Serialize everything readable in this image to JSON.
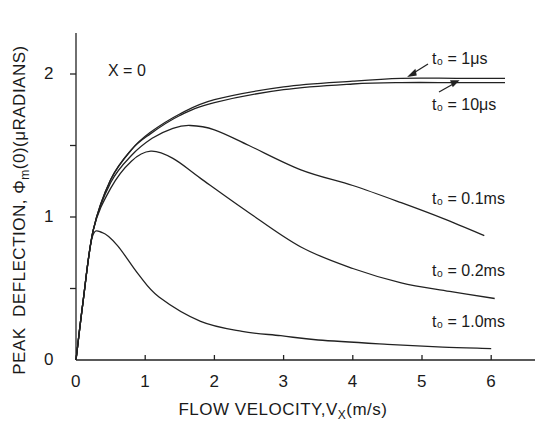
{
  "chart_data": {
    "type": "line",
    "title": "",
    "xlabel": "FLOW VELOCITY, Vx (m/s)",
    "ylabel": "PEAK DEFLECTION, Φm(0) (μRADIANS)",
    "xlim": [
      0,
      6.6
    ],
    "ylim": [
      0,
      2.3
    ],
    "x_ticks": [
      0,
      1,
      2,
      3,
      4,
      5,
      6
    ],
    "y_ticks": [
      0,
      0.5,
      1,
      1.5,
      2
    ],
    "y_tick_labels": [
      "0",
      "",
      "1",
      "",
      "2"
    ],
    "grid": false,
    "legend": "inline annotations",
    "annotations": [
      "X = 0"
    ],
    "series": [
      {
        "name": "t₀ = 1μs",
        "x": [
          0,
          0.1,
          0.25,
          0.5,
          0.8,
          1.07,
          1.5,
          2,
          3,
          4,
          4.7,
          5.5,
          6.2
        ],
        "y": [
          0,
          0.4,
          0.91,
          1.26,
          1.47,
          1.59,
          1.72,
          1.82,
          1.91,
          1.95,
          1.97,
          1.97,
          1.97
        ]
      },
      {
        "name": "t₀ = 10μs",
        "x": [
          0,
          0.1,
          0.25,
          0.5,
          0.8,
          1.07,
          1.5,
          2,
          3,
          4,
          4.7,
          5.5,
          6.2
        ],
        "y": [
          0,
          0.4,
          0.91,
          1.26,
          1.47,
          1.58,
          1.71,
          1.8,
          1.89,
          1.93,
          1.94,
          1.94,
          1.94
        ]
      },
      {
        "name": "t₀ = 0.1ms",
        "x": [
          0,
          0.1,
          0.25,
          0.5,
          0.8,
          1.1,
          1.4,
          1.65,
          2,
          2.5,
          3.25,
          4,
          4.7,
          5.3,
          5.9
        ],
        "y": [
          0,
          0.4,
          0.91,
          1.24,
          1.43,
          1.55,
          1.62,
          1.64,
          1.61,
          1.5,
          1.33,
          1.22,
          1.1,
          0.99,
          0.87
        ]
      },
      {
        "name": "t₀ = 0.2ms",
        "x": [
          0,
          0.1,
          0.25,
          0.5,
          0.8,
          1.08,
          1.4,
          1.8,
          2.5,
          3.25,
          4,
          4.7,
          5.4,
          6.05
        ],
        "y": [
          0,
          0.4,
          0.91,
          1.2,
          1.39,
          1.46,
          1.41,
          1.27,
          1.03,
          0.79,
          0.64,
          0.54,
          0.48,
          0.43
        ]
      },
      {
        "name": "t₀ = 1.0ms",
        "x": [
          0,
          0.1,
          0.23,
          0.38,
          0.6,
          0.9,
          1.2,
          1.8,
          2.4,
          2.96,
          3.5,
          4.5,
          5.3,
          6.0
        ],
        "y": [
          0,
          0.4,
          0.85,
          0.89,
          0.8,
          0.6,
          0.44,
          0.27,
          0.2,
          0.17,
          0.14,
          0.11,
          0.09,
          0.08
        ]
      }
    ]
  },
  "labels": {
    "ylabel": "PEAK  DEFLECTION, Φm(0) (μRADIANS)",
    "xlabel": "FLOW VELOCITY, Vx (m/s)",
    "x_ticks": [
      "0",
      "1",
      "2",
      "3",
      "4",
      "5",
      "6"
    ],
    "y_ticks": [
      "0",
      "1",
      "2"
    ],
    "annotation_x0": "X = 0",
    "curve_labels": [
      "t₀ = 1μs",
      "t₀ = 10μs",
      "t₀ = 0.1ms",
      "t₀ = 0.2ms",
      "t₀ = 1.0ms"
    ]
  }
}
